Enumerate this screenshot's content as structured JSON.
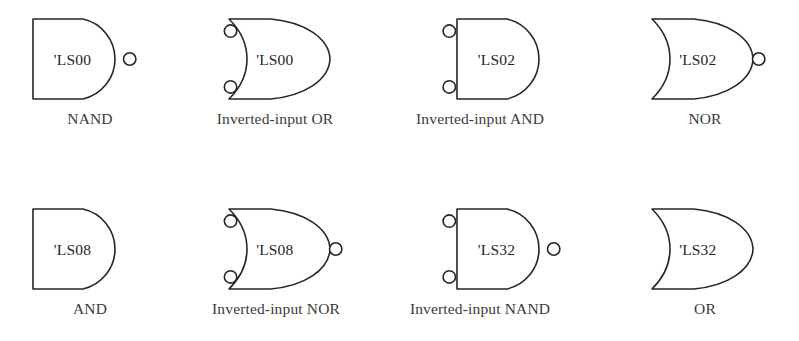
{
  "figure": {
    "width": 799,
    "height": 341,
    "background_color": "#ffffff",
    "line_color": "#262626",
    "text_color": "#3a3a3a"
  },
  "gates": [
    {
      "id": "gate-1",
      "shape": "and",
      "chip_label": "'LS00",
      "caption": "NAND",
      "input_bubbles": 0,
      "output_bubble": true,
      "row": 1,
      "column": 1,
      "x": 32,
      "y": 18,
      "body_width": 92,
      "body_height": 82,
      "caption_x": 10,
      "caption_y": 110,
      "caption_width": 160
    },
    {
      "id": "gate-2",
      "shape": "or",
      "chip_label": "'LS00",
      "caption": "Inverted-input OR",
      "input_bubbles": 2,
      "output_bubble": false,
      "row": 1,
      "column": 2,
      "x": 227,
      "y": 18,
      "body_width": 104,
      "body_height": 82,
      "caption_x": 185,
      "caption_y": 110,
      "caption_width": 180
    },
    {
      "id": "gate-3",
      "shape": "and",
      "chip_label": "'LS02",
      "caption": "Inverted-input AND",
      "input_bubbles": 2,
      "output_bubble": false,
      "row": 1,
      "column": 3,
      "x": 456,
      "y": 18,
      "body_width": 92,
      "body_height": 82,
      "caption_x": 380,
      "caption_y": 110,
      "caption_width": 200
    },
    {
      "id": "gate-4",
      "shape": "or",
      "chip_label": "'LS02",
      "caption": "NOR",
      "input_bubbles": 0,
      "output_bubble": true,
      "row": 1,
      "column": 4,
      "x": 650,
      "y": 18,
      "body_width": 104,
      "body_height": 82,
      "caption_x": 630,
      "caption_y": 110,
      "caption_width": 150
    },
    {
      "id": "gate-5",
      "shape": "and",
      "chip_label": "'LS08",
      "caption": "AND",
      "input_bubbles": 0,
      "output_bubble": false,
      "row": 2,
      "column": 1,
      "x": 32,
      "y": 208,
      "body_width": 92,
      "body_height": 82,
      "caption_x": 10,
      "caption_y": 300,
      "caption_width": 160
    },
    {
      "id": "gate-6",
      "shape": "or",
      "chip_label": "'LS08",
      "caption": "Inverted-input NOR",
      "input_bubbles": 2,
      "output_bubble": true,
      "row": 2,
      "column": 2,
      "x": 227,
      "y": 208,
      "body_width": 104,
      "body_height": 82,
      "caption_x": 180,
      "caption_y": 300,
      "caption_width": 192
    },
    {
      "id": "gate-7",
      "shape": "and",
      "chip_label": "'LS32",
      "caption": "Inverted-input NAND",
      "input_bubbles": 2,
      "output_bubble": true,
      "row": 2,
      "column": 3,
      "x": 456,
      "y": 208,
      "body_width": 92,
      "body_height": 82,
      "caption_x": 375,
      "caption_y": 300,
      "caption_width": 210
    },
    {
      "id": "gate-8",
      "shape": "or",
      "chip_label": "'LS32",
      "caption": "OR",
      "input_bubbles": 0,
      "output_bubble": false,
      "row": 2,
      "column": 4,
      "x": 650,
      "y": 208,
      "body_width": 104,
      "body_height": 82,
      "caption_x": 630,
      "caption_y": 300,
      "caption_width": 150
    }
  ]
}
